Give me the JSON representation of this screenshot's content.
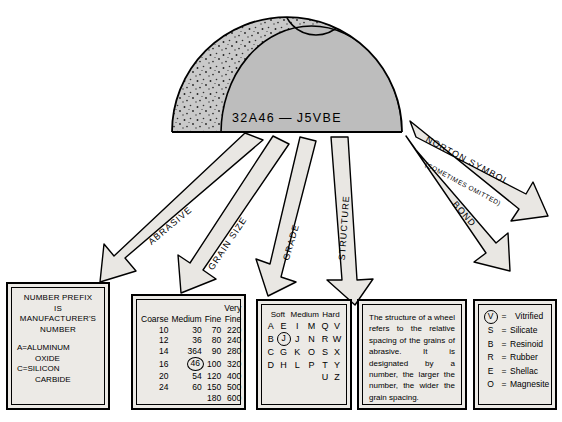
{
  "wheel": {
    "marking": "32A46 — J5VBE",
    "alt": "grinding-wheel-cross-section"
  },
  "arrows": [
    {
      "id": "abrasive",
      "label": "ABRASIVE"
    },
    {
      "id": "grain-size",
      "label": "GRAIN SIZE"
    },
    {
      "id": "grade",
      "label": "GRADE"
    },
    {
      "id": "structure",
      "label": "STRUCTURE"
    },
    {
      "id": "bond",
      "label": "BOND"
    },
    {
      "id": "norton",
      "label": "NORTON SYMBOL",
      "sublabel": "(SOMETIMES OMITTED)"
    }
  ],
  "prefix_box": {
    "title_lines": [
      "NUMBER PREFIX",
      "IS",
      "MANUFACTURER'S",
      "NUMBER"
    ],
    "entries": [
      {
        "code": "A",
        "eq": "=",
        "name": "ALUMINUM",
        "name2": "OXIDE"
      },
      {
        "code": "C",
        "eq": "=",
        "name": "SILICON",
        "name2": "CARBIDE"
      }
    ]
  },
  "grain_box": {
    "headers": [
      "Coarse",
      "Medium",
      "Fine",
      "Very"
    ],
    "header_second": "Fine",
    "rows": [
      [
        "10",
        "30",
        "70",
        "220"
      ],
      [
        "12",
        "36",
        "80",
        "240"
      ],
      [
        "14",
        "364",
        "90",
        "280"
      ],
      [
        "16",
        "46",
        "100",
        "320"
      ],
      [
        "20",
        "54",
        "120",
        "400"
      ],
      [
        "24",
        "60",
        "150",
        "500"
      ],
      [
        "",
        "",
        "180",
        "600"
      ]
    ],
    "circled": "46"
  },
  "grade_box": {
    "headers": [
      "Soft",
      "Medium",
      "Hard"
    ],
    "rows": [
      [
        "A",
        "E",
        "I",
        "M",
        "Q",
        "V"
      ],
      [
        "B",
        "F",
        "J",
        "N",
        "R",
        "W"
      ],
      [
        "C",
        "G",
        "K",
        "O",
        "S",
        "X"
      ],
      [
        "D",
        "H",
        "L",
        "P",
        "T",
        "Y"
      ],
      [
        "",
        "",
        "",
        "",
        "U",
        "Z"
      ]
    ],
    "circled": "J"
  },
  "structure_box": {
    "text": "The structure of a wheel refers to the relative spacing of the grains of abrasive. It is designated by a number, the larger the number, the wider the grain spacing."
  },
  "bond_box": {
    "rows": [
      {
        "code": "V",
        "eq": "=",
        "name": "Vitrified",
        "circled": true
      },
      {
        "code": "S",
        "eq": "=",
        "name": "Silicate",
        "circled": false
      },
      {
        "code": "B",
        "eq": "=",
        "name": "Resinoid",
        "circled": false
      },
      {
        "code": "R",
        "eq": "=",
        "name": "Rubber",
        "circled": false
      },
      {
        "code": "E",
        "eq": "=",
        "name": "Shellac",
        "circled": false
      },
      {
        "code": "O",
        "eq": "=",
        "name": "Magnesite",
        "circled": false
      }
    ]
  },
  "colors": {
    "panel_fill": "#eceae6",
    "wheel_body": "#bdbdbd",
    "wheel_rim": "#c9c9c9",
    "arrow_fill": "#e9e7e3",
    "outline": "#000000"
  }
}
